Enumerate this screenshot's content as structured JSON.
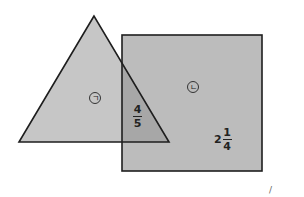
{
  "diagram": {
    "triangle": {
      "points": "94,16 19,142 169,142",
      "fill": "#c6c6c6",
      "stroke": "#1e1e1e",
      "label": "ㄱ"
    },
    "square": {
      "x": 122,
      "y": 35,
      "width": 140,
      "height": 136,
      "fill": "#bcbcbc",
      "stroke": "#1e1e1e",
      "label": "ㄴ"
    },
    "overlap": {
      "fill": "#a7a7a7",
      "fraction": {
        "numerator": "4",
        "denominator": "5"
      }
    },
    "square_value": {
      "whole": "2",
      "numerator": "1",
      "denominator": "4"
    },
    "corner_mark": "/"
  }
}
